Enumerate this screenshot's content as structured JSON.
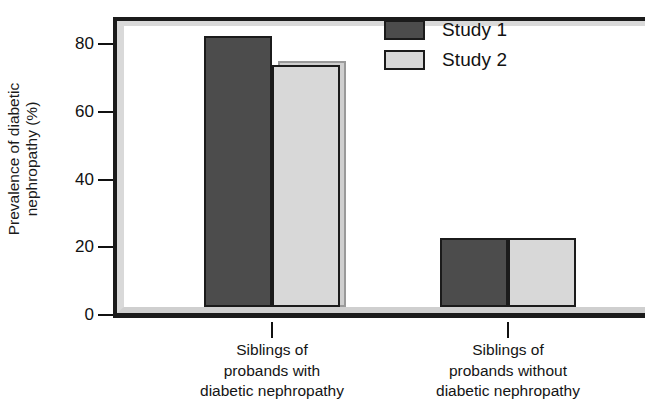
{
  "chart_data": {
    "type": "bar",
    "title": "",
    "xlabel": "",
    "ylabel_lines": [
      "Prevalence of diabetic",
      "nephropathy (%)"
    ],
    "ylabel": "Prevalence of diabetic nephropathy (%)",
    "ylim": [
      0,
      88
    ],
    "yticks": [
      0,
      20,
      40,
      60,
      80
    ],
    "ytick_labels": [
      "0",
      "20",
      "40",
      "60",
      "80"
    ],
    "grid": false,
    "legend_position": "top-right",
    "categories": [
      "Siblings of probands with diabetic nephropathy",
      "Siblings of probands without diabetic nephropathy"
    ],
    "category_label_lines": [
      [
        "Siblings of",
        "probands with",
        "diabetic nephropathy"
      ],
      [
        "Siblings of",
        "probands without",
        "diabetic nephropathy"
      ]
    ],
    "series": [
      {
        "name": "Study 1",
        "color": "#4c4c4c",
        "values": [
          80,
          20.5
        ]
      },
      {
        "name": "Study 2",
        "color": "#d8d8d8",
        "values": [
          71.5,
          20.5
        ]
      }
    ]
  },
  "legend": {
    "entries": [
      {
        "label": "Study 1",
        "color": "#4c4c4c"
      },
      {
        "label": "Study 2",
        "color": "#d8d8d8"
      }
    ]
  },
  "colors": {
    "series_1": "#4c4c4c",
    "series_2": "#d8d8d8",
    "outline": "#1b1b1b",
    "frame_inner": "#d9d9d9",
    "background": "#ffffff",
    "text": "#111111"
  }
}
